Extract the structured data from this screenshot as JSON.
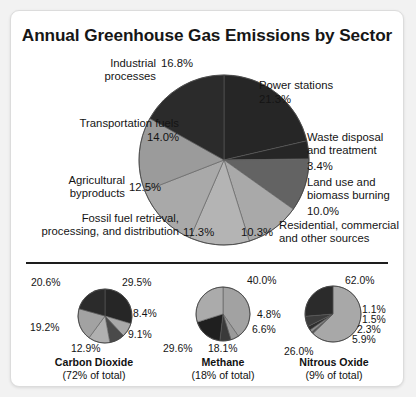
{
  "card": {
    "title": "Annual Greenhouse Gas Emissions by Sector"
  },
  "chart_data": [
    {
      "type": "pie",
      "id": "main",
      "title": "Annual Greenhouse Gas Emissions by Sector",
      "categories": [
        "Power stations",
        "Waste disposal and treatment",
        "Land use and biomass burning",
        "Residential, commercial and other sources",
        "Fossil fuel retrieval, processing, and distribution",
        "Agricultural byproducts",
        "Transportation fuels",
        "Industrial processes"
      ],
      "values": [
        21.3,
        3.4,
        10.0,
        10.3,
        11.3,
        12.5,
        14.0,
        16.8
      ],
      "value_labels": [
        "21.3%",
        "3.4%",
        "10.0%",
        "10.3%",
        "11.3%",
        "12.5%",
        "14.0%",
        "16.8%"
      ],
      "colors": [
        "#262626",
        "#262626",
        "#636363",
        "#a9a9a9",
        "#b4b4b4",
        "#a9a9a9",
        "#9b9b9b",
        "#2b2b2b"
      ],
      "start_angle_deg": 0,
      "direction": "clockwise",
      "legend": "none",
      "grid": false
    },
    {
      "type": "pie",
      "id": "carbon-dioxide",
      "title": "Carbon Dioxide",
      "subtitle": "(72% of total)",
      "values": [
        29.5,
        8.4,
        9.1,
        12.9,
        19.2,
        20.6
      ],
      "value_labels": [
        "29.5%",
        "8.4%",
        "9.1%",
        "12.9%",
        "19.2%",
        "20.6%"
      ],
      "colors": [
        "#262626",
        "#a9a9a9",
        "#4a4a4a",
        "#b0b0b0",
        "#a2a2a2",
        "#2b2b2b"
      ],
      "start_angle_deg": 0,
      "direction": "clockwise",
      "legend": "none",
      "grid": false
    },
    {
      "type": "pie",
      "id": "methane",
      "title": "Methane",
      "subtitle": "(18% of total)",
      "values": [
        40.0,
        4.8,
        6.6,
        18.1,
        29.6
      ],
      "value_labels": [
        "40.0%",
        "4.8%",
        "6.6%",
        "18.1%",
        "29.6%"
      ],
      "colors": [
        "#a2a2a2",
        "#9a9a9a",
        "#3a3a3a",
        "#1f1f1f",
        "#ababab"
      ],
      "start_angle_deg": 0,
      "direction": "clockwise",
      "legend": "none",
      "grid": false
    },
    {
      "type": "pie",
      "id": "nitrous-oxide",
      "title": "Nitrous Oxide",
      "subtitle": "(9% of total)",
      "values": [
        62.0,
        1.1,
        1.5,
        2.3,
        5.9,
        26.0
      ],
      "value_labels": [
        "62.0%",
        "1.1%",
        "1.5%",
        "2.3%",
        "5.9%",
        "26.0%"
      ],
      "colors": [
        "#a8a8a8",
        "#555555",
        "#8e8e8e",
        "#2e2e2e",
        "#3c3c3c",
        "#2b2b2b"
      ],
      "start_angle_deg": 0,
      "direction": "clockwise",
      "legend": "none",
      "grid": false
    }
  ],
  "main_labels": {
    "power_stations_name": "Power stations",
    "power_stations_pct": "21.3%",
    "waste_name_line1": "Waste disposal",
    "waste_name_line2": "and treatment",
    "waste_pct": "3.4%",
    "land_name_line1": "Land use and",
    "land_name_line2": "biomass burning",
    "land_pct": "10.0%",
    "residential_pct": "10.3%",
    "residential_name_line1": "Residential, commercial",
    "residential_name_line2": "and other sources",
    "fossil_name_line1": "Fossil fuel retrieval,",
    "fossil_name_line2": "processing, and distribution",
    "fossil_pct": "11.3%",
    "agricultural_name_line1": "Agricultural",
    "agricultural_name_line2": "byproducts",
    "agricultural_pct": "12.5%",
    "transportation_name": "Transportation fuels",
    "transportation_pct": "14.0%",
    "industrial_name_line1": "Industrial",
    "industrial_name_line2": "processes",
    "industrial_pct": "16.8%"
  },
  "subs": {
    "co2": {
      "name": "Carbon Dioxide",
      "share": "(72% of total)",
      "p1": "29.5%",
      "p2": "8.4%",
      "p3": "9.1%",
      "p4": "12.9%",
      "p5": "19.2%",
      "p6": "20.6%"
    },
    "ch4": {
      "name": "Methane",
      "share": "(18% of total)",
      "p1": "40.0%",
      "p2": "4.8%",
      "p3": "6.6%",
      "p4": "18.1%",
      "p5": "29.6%"
    },
    "n2o": {
      "name": "Nitrous Oxide",
      "share": "(9% of total)",
      "p1": "62.0%",
      "p2": "1.1%",
      "p3": "1.5%",
      "p4": "2.3%",
      "p5": "5.9%",
      "p6": "26.0%"
    }
  }
}
